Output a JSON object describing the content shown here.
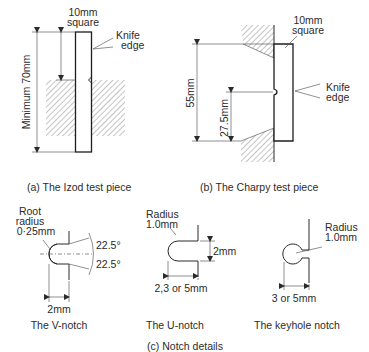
{
  "figure": {
    "izod": {
      "size_label_1": "10mm",
      "size_label_2": "square",
      "knife_label_1": "Knife",
      "knife_label_2": "edge",
      "length_label": "Minimum 70mm",
      "caption": "(a)  The Izod test piece"
    },
    "charpy": {
      "size_label_1": "10mm",
      "size_label_2": "square",
      "knife_label_1": "Knife",
      "knife_label_2": "edge",
      "length_label": "55mm",
      "half_length_label": "27.5mm",
      "caption": "(b)  The Charpy test piece"
    },
    "notches": {
      "v_notch": {
        "radius_label_1": "Root",
        "radius_label_2": "radius",
        "radius_label_3": "0·25mm",
        "angle_upper": "22.5°",
        "angle_lower": "22.5°",
        "depth_label": "2mm",
        "caption": "The V-notch"
      },
      "u_notch": {
        "radius_label_1": "Radius",
        "radius_label_2": "1.0mm",
        "width_label": "2mm",
        "depth_label": "2,3 or 5mm",
        "caption": "The U-notch"
      },
      "keyhole_notch": {
        "radius_label_1": "Radius",
        "radius_label_2": "1.0mm",
        "depth_label": "3 or 5mm",
        "caption": "The keyhole notch"
      },
      "caption": "(c)  Notch details"
    }
  }
}
